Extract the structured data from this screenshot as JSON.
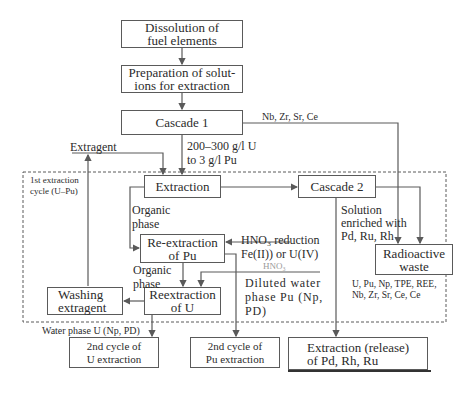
{
  "boxes": {
    "dissolution": "Dissolution of\nfuel elements",
    "preparation": "Preparation of solut-\nions for extraction",
    "cascade1": "Cascade 1",
    "extraction": "Extraction",
    "cascade2": "Cascade 2",
    "reextraction_pu": "Re-extraction\nof Pu",
    "radioactive_waste": "Radioactive\nwaste",
    "washing_extragent": "Washing\nextragent",
    "reextraction_u": "Reextraction\nof U",
    "second_cycle_u": "2nd cycle of\nU extraction",
    "second_cycle_pu": "2nd cycle of\nPu extraction",
    "extraction_release": "Extraction (release)\nof Pd, Rh, Ru"
  },
  "labels": {
    "nb_zr": "Nb, Zr, Sr, Ce",
    "concentration": "200–300 g/l U\nto 3 g/l Pu",
    "extragent": "Extragent",
    "cycle": "1st extraction\ncycle (U–Pu)",
    "organic_phase_1": "Organic\nphase",
    "organic_phase_2": "Organic\nphase",
    "hno3_reduction": "HNO₃ reduction\nFe(II)) or U(IV)",
    "hno3": "HNO₃",
    "solution_enriched": "Solution\nenriched with\nPd, Ru, Rh",
    "diluted_water": "Diluted water\nphase Pu (Np,\nPD)",
    "waste_components": "U, Pu, Np, TPE, REE,\nNb, Zr, Sr, Ce, Ce",
    "water_phase_u": "Water phase U (Np, PD)"
  },
  "colors": {
    "line": "#5a5a5a",
    "text": "#2b2b2b",
    "muted": "#9a9a9a"
  }
}
